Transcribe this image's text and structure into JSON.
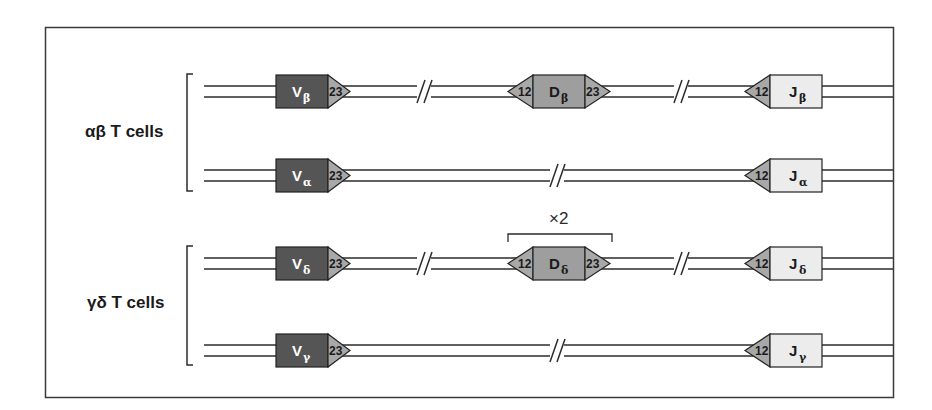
{
  "figure": {
    "colors": {
      "frame": "#3a3a3a",
      "line": "#2b2b2b",
      "v_segment": "#555555",
      "d_segment": "#9e9e9e",
      "j_segment": "#ececec",
      "rss": "#a8a8a8",
      "text_dark": "#1a1a1a"
    },
    "groups": [
      {
        "label": "αβ T cells"
      },
      {
        "label": "γδ T cells"
      }
    ],
    "loci": [
      {
        "name": "beta",
        "v": {
          "main": "V",
          "sub": "β",
          "rss": "23"
        },
        "d": {
          "main": "D",
          "sub": "β",
          "rss_left": "12",
          "rss_right": "23"
        },
        "j": {
          "main": "J",
          "sub": "β",
          "rss": "12"
        },
        "breaks": 2
      },
      {
        "name": "alpha",
        "v": {
          "main": "V",
          "sub": "α",
          "rss": "23"
        },
        "j": {
          "main": "J",
          "sub": "α",
          "rss": "12"
        },
        "breaks": 1
      },
      {
        "name": "delta",
        "v": {
          "main": "V",
          "sub": "δ",
          "rss": "23"
        },
        "d": {
          "main": "D",
          "sub": "δ",
          "rss_left": "12",
          "rss_right": "23"
        },
        "j": {
          "main": "J",
          "sub": "δ",
          "rss": "12"
        },
        "multiplier": "×2",
        "breaks": 2
      },
      {
        "name": "gamma",
        "v": {
          "main": "V",
          "sub": "γ",
          "rss": "23"
        },
        "j": {
          "main": "J",
          "sub": "γ",
          "rss": "12"
        },
        "breaks": 1
      }
    ]
  }
}
